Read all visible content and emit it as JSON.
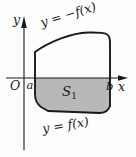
{
  "figure": {
    "kind": "calculus-region-diagram",
    "background_color": "#fdfdfd",
    "stroke_color": "#1a1a1a",
    "shade_color": "#b8b8b8",
    "axes": {
      "x_axis_label": "x",
      "y_axis_label": "y",
      "origin_label": "O",
      "left_bound_label": "a",
      "right_bound_label": "b",
      "x_axis_y": 78,
      "y_axis_x": 24,
      "x_axis_start": 6,
      "x_axis_end": 127,
      "y_axis_top": 16,
      "y_axis_bottom": 150
    },
    "region": {
      "name_label": "S",
      "name_subscript": "1",
      "fill_color": "#b8b8b8",
      "x_left": 35,
      "x_right": 110
    },
    "curves": {
      "upper_label": "y = −f(x)",
      "lower_label": "y = f(x)",
      "upper_label_rotation": -17,
      "lower_label_rotation": -9
    }
  }
}
